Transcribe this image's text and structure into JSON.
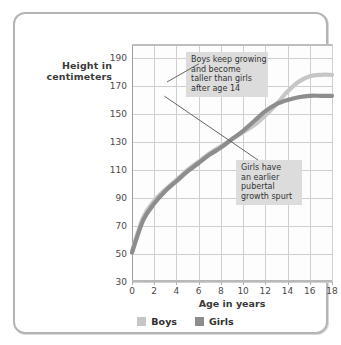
{
  "chart_data": {
    "type": "line",
    "title": "",
    "xlabel": "Age in years",
    "ylabel": "Height in centimeters",
    "xlim": [
      0,
      18
    ],
    "ylim": [
      30,
      200
    ],
    "xticks": [
      0,
      2,
      4,
      6,
      8,
      10,
      12,
      14,
      16,
      18
    ],
    "yticks": [
      30,
      50,
      70,
      90,
      110,
      130,
      150,
      170,
      190
    ],
    "grid": true,
    "legend_position": "bottom",
    "x": [
      0,
      1,
      2,
      3,
      4,
      5,
      6,
      7,
      8,
      9,
      10,
      11,
      12,
      13,
      14,
      15,
      16,
      17,
      18
    ],
    "series": [
      {
        "name": "Boys",
        "color": "#c6c6c6",
        "values": [
          52,
          76,
          88,
          96,
          103,
          110,
          116,
          122,
          127,
          132,
          137,
          142,
          149,
          157,
          166,
          173,
          177,
          178,
          178
        ]
      },
      {
        "name": "Girls",
        "color": "#8d8d8d",
        "values": [
          51,
          74,
          86,
          95,
          102,
          109,
          115,
          121,
          126,
          132,
          138,
          145,
          152,
          157,
          160,
          162,
          163,
          163,
          163
        ]
      }
    ],
    "annotations": [
      {
        "name": "boys-growth-note",
        "lines": [
          "Boys keep growing",
          "and become",
          "taller than girls",
          "after age 14"
        ],
        "points_to_series": "Boys",
        "points_to_age": 15
      },
      {
        "name": "girls-spurt-note",
        "lines": [
          "Girls have",
          "an earlier",
          "pubertal",
          "growth spurt"
        ],
        "points_to_series": "Girls",
        "points_to_age": 12
      }
    ]
  },
  "axes": {
    "y_title_line1": "Height in",
    "y_title_line2": "centimeters",
    "x_title": "Age in years"
  },
  "legend": {
    "items": [
      {
        "label": "Boys",
        "color": "#c6c6c6"
      },
      {
        "label": "Girls",
        "color": "#8d8d8d"
      }
    ]
  },
  "colors": {
    "boys": "#c6c6c6",
    "girls": "#8d8d8d",
    "grid": "#cfcfcf",
    "frame": "#b4b4b4",
    "annotation_bg": "#dcdcdc",
    "text": "#3a3a3a"
  }
}
